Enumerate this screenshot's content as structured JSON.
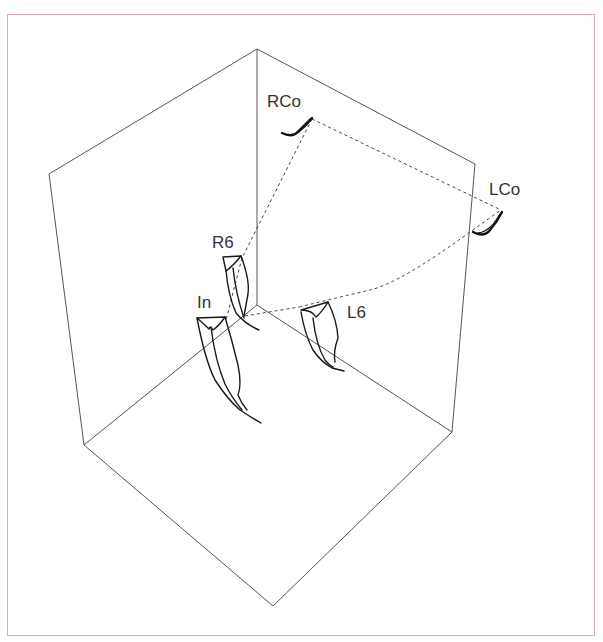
{
  "figure": {
    "labels": {
      "rco": "RCo",
      "lco": "LCo",
      "r6": "R6",
      "in": "In",
      "l6": "L6"
    },
    "colors": {
      "frame_border": "#e8a8b0",
      "cube_edge": "#555555",
      "trace": "#1a1a1a",
      "label": "#333333"
    },
    "cube_vertices": {
      "top": [
        257,
        49
      ],
      "upper_left": [
        49,
        174
      ],
      "upper_right": [
        475,
        164
      ],
      "center": [
        257,
        305
      ],
      "lower_left": [
        84,
        445
      ],
      "lower_right": [
        452,
        432
      ],
      "bottom": [
        273,
        606
      ]
    }
  }
}
